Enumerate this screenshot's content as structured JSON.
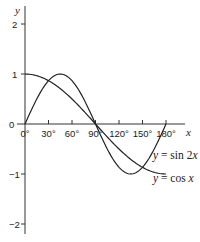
{
  "chart_data": {
    "type": "line",
    "title": "",
    "xlabel": "x",
    "ylabel": "y",
    "x_ticks": [
      "0°",
      "30°",
      "60°",
      "90°",
      "120°",
      "150°",
      "180°"
    ],
    "x_tick_values": [
      0,
      30,
      60,
      90,
      120,
      150,
      180
    ],
    "y_ticks": [
      "2",
      "1",
      "0",
      "−1",
      "−2"
    ],
    "y_tick_values": [
      2,
      1,
      0,
      -1,
      -2
    ],
    "xlim": [
      0,
      180
    ],
    "ylim": [
      -2,
      2
    ],
    "grid": false,
    "legend": "inline labels at curve ends",
    "series": [
      {
        "name": "y = sin 2x",
        "x": [
          0,
          15,
          30,
          45,
          60,
          75,
          90,
          105,
          120,
          135,
          150,
          165,
          180
        ],
        "values": [
          0,
          0.5,
          0.866,
          1,
          0.866,
          0.5,
          0,
          -0.5,
          -0.866,
          -1,
          -0.866,
          -0.5,
          0
        ]
      },
      {
        "name": "y = cos x",
        "x": [
          0,
          15,
          30,
          45,
          60,
          75,
          90,
          105,
          120,
          135,
          150,
          165,
          180
        ],
        "values": [
          1,
          0.966,
          0.866,
          0.707,
          0.5,
          0.259,
          0,
          -0.259,
          -0.5,
          -0.707,
          -0.866,
          -0.966,
          -1
        ]
      }
    ],
    "annotations": [
      {
        "text_prefix": "y",
        "text_suffix": " = sin 2",
        "text_var": "x",
        "series": "y = sin 2x"
      },
      {
        "text_prefix": "y",
        "text_suffix": " = cos ",
        "text_var": "x",
        "series": "y = cos x"
      }
    ]
  }
}
